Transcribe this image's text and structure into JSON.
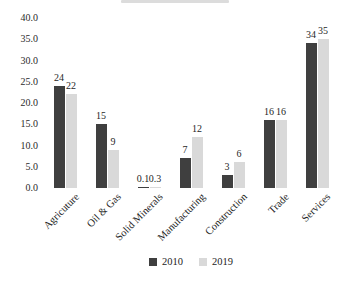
{
  "chart_data": {
    "type": "bar",
    "categories": [
      "Agricuture",
      "Oil & Gas",
      "Solid Minerals",
      "Manufacturing",
      "Construction",
      "Trade",
      "Services"
    ],
    "series": [
      {
        "name": "2010",
        "color": "#3f3f3f",
        "values": [
          24,
          15,
          0.1,
          7,
          3,
          16,
          34
        ],
        "labels": [
          "24",
          "15",
          "0.1",
          "7",
          "3",
          "16",
          "34"
        ]
      },
      {
        "name": "2019",
        "color": "#d9d9d9",
        "values": [
          22,
          9,
          0.3,
          12,
          6,
          16,
          35
        ],
        "labels": [
          "22",
          "9",
          "0.3",
          "12",
          "6",
          "16",
          "35"
        ]
      }
    ],
    "title": "",
    "xlabel": "",
    "ylabel": "",
    "ylim": [
      0,
      40
    ],
    "yticks": [
      "40.0",
      "35.0",
      "30.0",
      "25.0",
      "20.0",
      "15.0",
      "10.0",
      "5.0",
      "0.0"
    ],
    "grid": false,
    "legend_position": "bottom",
    "x_label_rotation_deg": 45
  },
  "legend": {
    "items": [
      {
        "label": "2010",
        "color": "#3f3f3f"
      },
      {
        "label": "2019",
        "color": "#d9d9d9"
      }
    ]
  }
}
